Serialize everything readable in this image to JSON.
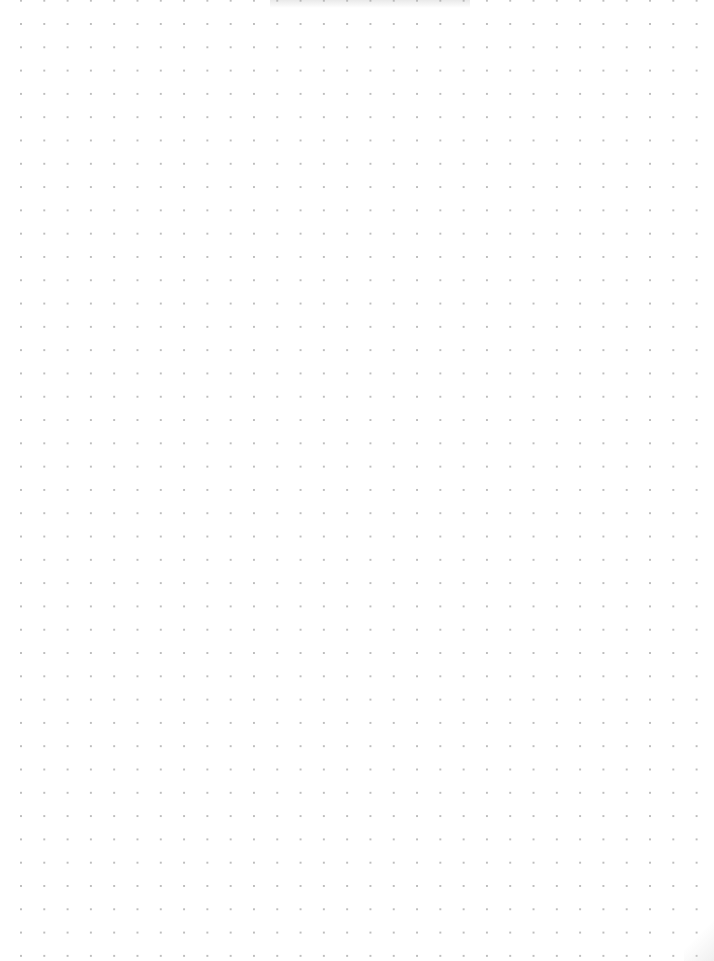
{
  "page": {
    "type": "dot-grid-paper",
    "colors": {
      "background": "#ffffff",
      "dot": "#bdbdbd"
    },
    "grid": {
      "pitch_px": 23.3,
      "columns": 30,
      "rows": 41
    }
  }
}
